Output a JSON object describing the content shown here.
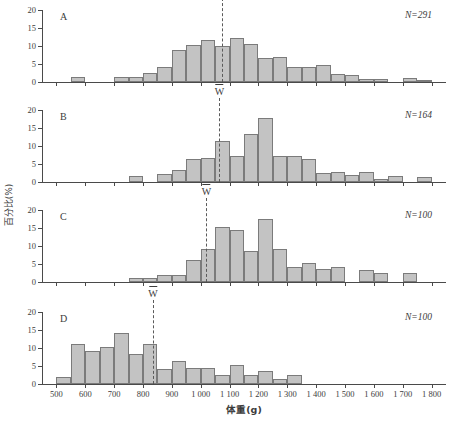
{
  "chart_data": {
    "type": "bar",
    "title": "",
    "xlabel": "体重(g)",
    "ylabel": "百分比(%)",
    "xlim": [
      450,
      1850
    ],
    "ylim": [
      0,
      20
    ],
    "bin_width": 50,
    "xticks": [
      500,
      600,
      700,
      800,
      900,
      1000,
      1100,
      1200,
      1300,
      1400,
      1500,
      1600,
      1700,
      1800
    ],
    "xtick_labels": [
      "500",
      "600",
      "700",
      "800",
      "900",
      "1 000",
      "1 100",
      "1 200",
      "1 300",
      "1 400",
      "1 500",
      "1 600",
      "1 700",
      "1 800"
    ],
    "yticks": [
      0,
      5,
      10,
      15,
      20
    ],
    "ytick_labels": [
      "0",
      "5",
      "10",
      "15",
      "20"
    ],
    "grid": false,
    "legend": "none",
    "panels": [
      {
        "letter": "A",
        "n_label": "N=291",
        "mean_label": "W",
        "mean_x": 1075,
        "bins": [
          {
            "x0": 550,
            "x1": 600,
            "value": 1.4
          },
          {
            "x0": 700,
            "x1": 750,
            "value": 1.4
          },
          {
            "x0": 750,
            "x1": 800,
            "value": 1.4
          },
          {
            "x0": 800,
            "x1": 850,
            "value": 2.4
          },
          {
            "x0": 850,
            "x1": 900,
            "value": 4.3
          },
          {
            "x0": 900,
            "x1": 950,
            "value": 8.9
          },
          {
            "x0": 950,
            "x1": 1000,
            "value": 10.4
          },
          {
            "x0": 1000,
            "x1": 1050,
            "value": 11.7
          },
          {
            "x0": 1050,
            "x1": 1100,
            "value": 9.9
          },
          {
            "x0": 1100,
            "x1": 1150,
            "value": 12.2
          },
          {
            "x0": 1150,
            "x1": 1200,
            "value": 10.6
          },
          {
            "x0": 1200,
            "x1": 1250,
            "value": 6.6
          },
          {
            "x0": 1250,
            "x1": 1300,
            "value": 7.0
          },
          {
            "x0": 1300,
            "x1": 1350,
            "value": 4.2
          },
          {
            "x0": 1350,
            "x1": 1400,
            "value": 4.1
          },
          {
            "x0": 1400,
            "x1": 1450,
            "value": 4.7
          },
          {
            "x0": 1450,
            "x1": 1500,
            "value": 2.2
          },
          {
            "x0": 1500,
            "x1": 1550,
            "value": 1.9
          },
          {
            "x0": 1550,
            "x1": 1600,
            "value": 0.9
          },
          {
            "x0": 1600,
            "x1": 1650,
            "value": 0.9
          },
          {
            "x0": 1700,
            "x1": 1750,
            "value": 1.2
          },
          {
            "x0": 1750,
            "x1": 1800,
            "value": 0.6
          }
        ]
      },
      {
        "letter": "B",
        "n_label": "N=164",
        "mean_label": "W",
        "mean_x": 1065,
        "bins": [
          {
            "x0": 750,
            "x1": 800,
            "value": 1.6
          },
          {
            "x0": 850,
            "x1": 900,
            "value": 2.1
          },
          {
            "x0": 900,
            "x1": 950,
            "value": 3.3
          },
          {
            "x0": 950,
            "x1": 1000,
            "value": 6.3
          },
          {
            "x0": 1000,
            "x1": 1050,
            "value": 6.8
          },
          {
            "x0": 1050,
            "x1": 1100,
            "value": 11.4
          },
          {
            "x0": 1100,
            "x1": 1150,
            "value": 7.3
          },
          {
            "x0": 1150,
            "x1": 1200,
            "value": 13.2
          },
          {
            "x0": 1200,
            "x1": 1250,
            "value": 17.9
          },
          {
            "x0": 1250,
            "x1": 1300,
            "value": 7.1
          },
          {
            "x0": 1300,
            "x1": 1350,
            "value": 7.1
          },
          {
            "x0": 1350,
            "x1": 1400,
            "value": 6.5
          },
          {
            "x0": 1400,
            "x1": 1450,
            "value": 2.4
          },
          {
            "x0": 1450,
            "x1": 1500,
            "value": 2.8
          },
          {
            "x0": 1500,
            "x1": 1550,
            "value": 2.0
          },
          {
            "x0": 1550,
            "x1": 1600,
            "value": 2.8
          },
          {
            "x0": 1600,
            "x1": 1650,
            "value": 0.8
          },
          {
            "x0": 1650,
            "x1": 1700,
            "value": 1.7
          },
          {
            "x0": 1750,
            "x1": 1800,
            "value": 1.4
          }
        ]
      },
      {
        "letter": "C",
        "n_label": "N=100",
        "mean_label": "W",
        "mean_x": 1020,
        "bins": [
          {
            "x0": 750,
            "x1": 800,
            "value": 1.0
          },
          {
            "x0": 800,
            "x1": 850,
            "value": 1.0
          },
          {
            "x0": 850,
            "x1": 900,
            "value": 2.0
          },
          {
            "x0": 900,
            "x1": 950,
            "value": 2.0
          },
          {
            "x0": 950,
            "x1": 1000,
            "value": 6.2
          },
          {
            "x0": 1000,
            "x1": 1050,
            "value": 9.3
          },
          {
            "x0": 1050,
            "x1": 1100,
            "value": 15.3
          },
          {
            "x0": 1100,
            "x1": 1150,
            "value": 14.4
          },
          {
            "x0": 1150,
            "x1": 1200,
            "value": 8.5
          },
          {
            "x0": 1200,
            "x1": 1250,
            "value": 17.6
          },
          {
            "x0": 1250,
            "x1": 1300,
            "value": 9.3
          },
          {
            "x0": 1300,
            "x1": 1350,
            "value": 4.1
          },
          {
            "x0": 1350,
            "x1": 1400,
            "value": 5.2
          },
          {
            "x0": 1400,
            "x1": 1450,
            "value": 3.6
          },
          {
            "x0": 1450,
            "x1": 1500,
            "value": 4.3
          },
          {
            "x0": 1550,
            "x1": 1600,
            "value": 3.2
          },
          {
            "x0": 1600,
            "x1": 1650,
            "value": 2.5
          },
          {
            "x0": 1700,
            "x1": 1750,
            "value": 2.5
          }
        ]
      },
      {
        "letter": "D",
        "n_label": "N=100",
        "mean_label": "W",
        "mean_x": 835,
        "bins": [
          {
            "x0": 500,
            "x1": 550,
            "value": 2.0
          },
          {
            "x0": 550,
            "x1": 600,
            "value": 11.0
          },
          {
            "x0": 600,
            "x1": 650,
            "value": 9.2
          },
          {
            "x0": 650,
            "x1": 700,
            "value": 10.3
          },
          {
            "x0": 700,
            "x1": 750,
            "value": 14.3
          },
          {
            "x0": 750,
            "x1": 800,
            "value": 8.4
          },
          {
            "x0": 800,
            "x1": 850,
            "value": 11.2
          },
          {
            "x0": 850,
            "x1": 900,
            "value": 4.3
          },
          {
            "x0": 900,
            "x1": 950,
            "value": 6.4
          },
          {
            "x0": 950,
            "x1": 1000,
            "value": 4.5
          },
          {
            "x0": 1000,
            "x1": 1050,
            "value": 4.5
          },
          {
            "x0": 1050,
            "x1": 1100,
            "value": 2.5
          },
          {
            "x0": 1100,
            "x1": 1150,
            "value": 5.4
          },
          {
            "x0": 1150,
            "x1": 1200,
            "value": 2.6
          },
          {
            "x0": 1200,
            "x1": 1250,
            "value": 3.6
          },
          {
            "x0": 1250,
            "x1": 1300,
            "value": 1.5
          },
          {
            "x0": 1300,
            "x1": 1350,
            "value": 2.6
          }
        ]
      }
    ]
  }
}
